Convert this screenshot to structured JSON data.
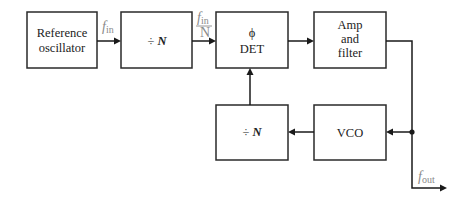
{
  "diagram": {
    "blocks": {
      "ref_osc": {
        "line1": "Reference",
        "line2": "oscillator"
      },
      "div_in": {
        "symbol": "÷",
        "var": "N"
      },
      "phase_det": {
        "line1": "ϕ",
        "line2": "DET"
      },
      "amp_filter": {
        "line1": "Amp",
        "line2": "and",
        "line3": "filter"
      },
      "vco": {
        "label": "VCO"
      },
      "div_fb": {
        "symbol": "÷",
        "var": "N"
      }
    },
    "signals": {
      "fin": {
        "base": "f",
        "sub": "in"
      },
      "fin_over_n": {
        "num_base": "f",
        "num_sub": "in",
        "den": "N"
      },
      "fout": {
        "base": "f",
        "sub": "out"
      }
    },
    "colors": {
      "box_stroke": "#2a2a2a",
      "wire": "#1a1a1a",
      "signal_label": "#8a8a8a"
    }
  }
}
